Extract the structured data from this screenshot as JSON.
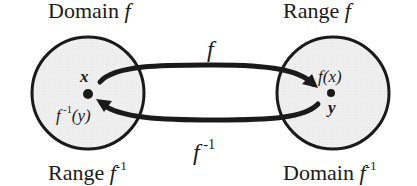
{
  "diagram": {
    "labels": {
      "domain_f": {
        "text": "Domain ",
        "fn": "f"
      },
      "range_f": {
        "text": "Range ",
        "fn": "f"
      },
      "range_finv": {
        "text": "Range ",
        "fn": "f",
        "exp": "-1"
      },
      "domain_finv": {
        "text": "Domain ",
        "fn": "f",
        "exp": "-1"
      },
      "arrow_f": "f",
      "arrow_finv": {
        "fn": "f",
        "exp": " -1"
      },
      "point_x": "x",
      "point_finv_y": {
        "fn": "f",
        "exp": " -1",
        "arg": "(y)"
      },
      "point_fx": "f(x)",
      "point_y": "y"
    },
    "colors": {
      "ink": "#1a1a1a",
      "circle_fill": "#ececec",
      "background": "#ffffff"
    }
  }
}
